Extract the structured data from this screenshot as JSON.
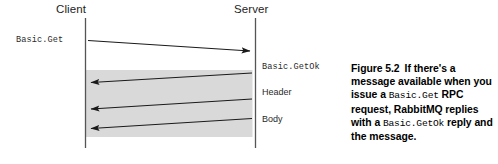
{
  "figure": {
    "type": "sequence-diagram",
    "actors": [
      {
        "id": "client",
        "label": "Client"
      },
      {
        "id": "server",
        "label": "Server"
      }
    ],
    "messages": [
      {
        "id": "basic-get",
        "label": "Basic.Get",
        "font": "mono",
        "direction": "client-to-server",
        "side": "left"
      },
      {
        "id": "basic-getok",
        "label": "Basic.GetOk",
        "font": "mono",
        "direction": "server-to-client",
        "side": "right"
      },
      {
        "id": "header",
        "label": "Header",
        "font": "sans",
        "direction": "server-to-client",
        "side": "right"
      },
      {
        "id": "body",
        "label": "Body",
        "font": "sans",
        "direction": "server-to-client",
        "side": "right"
      }
    ],
    "highlight_band": {
      "fill": "#d9d9d9",
      "note": "shaded region covering the three server-to-client reply arrows"
    },
    "colors": {
      "lifeline": "#555555",
      "arrow": "#1a1a1a",
      "band": "#d9d9d9",
      "background": "#ffffff"
    }
  },
  "caption": {
    "number": "Figure 5.2",
    "part1": "If there's a message available when you issue a ",
    "code1": "Basic.Get",
    "part2": " RPC request, RabbitMQ replies with a ",
    "code2": "Basic.GetOk",
    "part3": " reply and the message.",
    "full_text": "Figure 5.2  If there's a message available when you issue a Basic.Get RPC request, RabbitMQ replies with a Basic.GetOk reply and the message."
  }
}
